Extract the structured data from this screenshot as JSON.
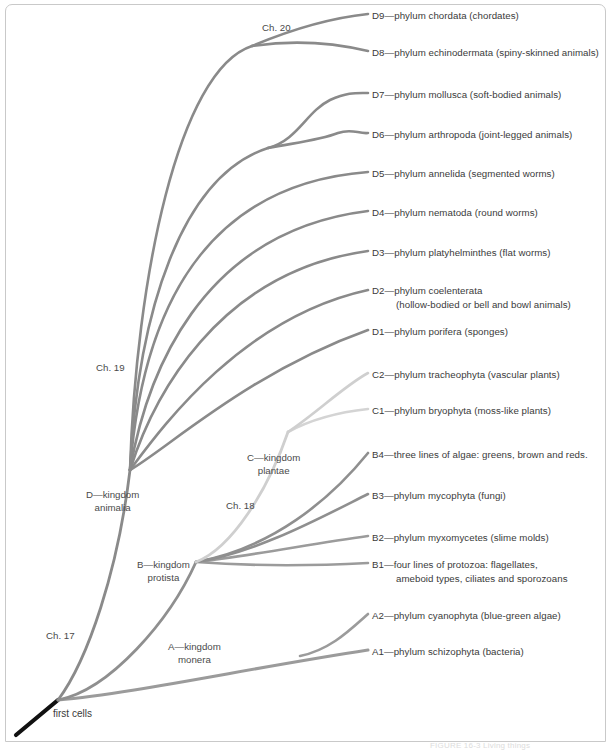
{
  "figure": {
    "caption": "FIGURE 16-3 Living things",
    "root_label": "first cells",
    "background_color": "#ffffff",
    "frame_color": "#c9c9c9"
  },
  "palette": {
    "animal_branch": "#8a8a8a",
    "protist_branch": "#9a9a9a",
    "plant_branch": "#cccccc",
    "monera_branch": "#999999",
    "root_stem": "#111111",
    "text": "#3a3a3a"
  },
  "chapters": [
    {
      "id": "ch17",
      "label": "Ch. 17",
      "x": 46,
      "y": 630
    },
    {
      "id": "ch18",
      "label": "Ch. 18",
      "x": 226,
      "y": 500
    },
    {
      "id": "ch19",
      "label": "Ch. 19",
      "x": 96,
      "y": 362
    },
    {
      "id": "ch20",
      "label": "Ch. 20",
      "x": 262,
      "y": 22
    }
  ],
  "kingdoms": [
    {
      "id": "monera",
      "line1": "A—kingdom",
      "line2": "monera",
      "x": 168,
      "y": 640
    },
    {
      "id": "protista",
      "line1": "B—kingdom",
      "line2": "protista",
      "x": 137,
      "y": 558
    },
    {
      "id": "plantae",
      "line1": "C—kingdom",
      "line2": "plantae",
      "x": 247,
      "y": 451
    },
    {
      "id": "animalia",
      "line1": "D—kingdom",
      "line2": "animalia",
      "x": 86,
      "y": 488
    }
  ],
  "leaves": [
    {
      "id": "D9",
      "line1": "D9—phylum chordata (chordates)",
      "line2": "",
      "x": 372,
      "y": 9
    },
    {
      "id": "D8",
      "line1": "D8—phylum echinodermata (spiny-skinned animals)",
      "line2": "",
      "x": 372,
      "y": 46
    },
    {
      "id": "D7",
      "line1": "D7—phylum mollusca (soft-bodied animals)",
      "line2": "",
      "x": 372,
      "y": 88
    },
    {
      "id": "D6",
      "line1": "D6—phylum arthropoda (joint-legged animals)",
      "line2": "",
      "x": 372,
      "y": 128
    },
    {
      "id": "D5",
      "line1": "D5—phylum annelida (segmented worms)",
      "line2": "",
      "x": 372,
      "y": 167
    },
    {
      "id": "D4",
      "line1": "D4—phylum nematoda (round worms)",
      "line2": "",
      "x": 372,
      "y": 206
    },
    {
      "id": "D3",
      "line1": "D3—phylum platyhelminthes (flat worms)",
      "line2": "",
      "x": 372,
      "y": 246
    },
    {
      "id": "D2",
      "line1": "D2—phylum coelenterata",
      "line2": "(hollow-bodied or bell and bowl animals)",
      "x": 372,
      "y": 284
    },
    {
      "id": "D1",
      "line1": "D1—phylum porifera (sponges)",
      "line2": "",
      "x": 372,
      "y": 325
    },
    {
      "id": "C2",
      "line1": "C2—phylum tracheophyta (vascular plants)",
      "line2": "",
      "x": 372,
      "y": 368
    },
    {
      "id": "C1",
      "line1": "C1—phylum bryophyta (moss-like plants)",
      "line2": "",
      "x": 372,
      "y": 404
    },
    {
      "id": "B4",
      "line1": "B4—three lines of algae: greens, brown and reds.",
      "line2": "",
      "x": 372,
      "y": 448
    },
    {
      "id": "B3",
      "line1": "B3—phylum mycophyta (fungi)",
      "line2": "",
      "x": 372,
      "y": 489
    },
    {
      "id": "B2",
      "line1": "B2—phylum myxomycetes (slime molds)",
      "line2": "",
      "x": 372,
      "y": 531
    },
    {
      "id": "B1",
      "line1": "B1—four lines of protozoa: flagellates,",
      "line2": "ameboid types, ciliates and sporozoans",
      "x": 372,
      "y": 558
    },
    {
      "id": "A2",
      "line1": "A2—phylum cyanophyta (blue-green algae)",
      "line2": "",
      "x": 372,
      "y": 609
    },
    {
      "id": "A1",
      "line1": "A1—phylum schizophyta (bacteria)",
      "line2": "",
      "x": 372,
      "y": 645
    }
  ],
  "branches": [
    {
      "id": "root-stem",
      "d": "M 16 735 L 58 700",
      "color": "#111111",
      "width": 4.2
    },
    {
      "id": "branch-monera",
      "d": "M 58 700 C 130 694 250 668 368 650",
      "color": "#9b9b9b",
      "width": 3.0
    },
    {
      "id": "branch-A2",
      "d": "M 300 656 C 330 650 350 630 368 614",
      "color": "#9b9b9b",
      "width": 2.6
    },
    {
      "id": "branch-protista",
      "d": "M 58 700 C 110 690 170 620 196 562",
      "color": "#8f8f8f",
      "width": 2.8
    },
    {
      "id": "branch-B1",
      "d": "M 196 562 C 250 566 310 566 368 563",
      "color": "#9b9b9b",
      "width": 2.6
    },
    {
      "id": "branch-B2",
      "d": "M 196 562 C 250 556 310 544 368 536",
      "color": "#9b9b9b",
      "width": 2.6
    },
    {
      "id": "branch-B3",
      "d": "M 196 562 C 258 552 320 518 368 494",
      "color": "#8f8f8f",
      "width": 2.6
    },
    {
      "id": "branch-B4",
      "d": "M 196 562 C 272 548 330 500 368 453",
      "color": "#8f8f8f",
      "width": 2.6
    },
    {
      "id": "branch-plantae",
      "d": "M 196 562 C 232 548 268 490 288 432",
      "color": "#cfcfcf",
      "width": 2.8
    },
    {
      "id": "branch-C1",
      "d": "M 288 432 C 310 420 340 412 368 409",
      "color": "#d4d4d4",
      "width": 2.6
    },
    {
      "id": "branch-C2",
      "d": "M 288 432 C 318 412 344 386 368 373",
      "color": "#cfcfcf",
      "width": 2.6
    },
    {
      "id": "branch-animalia",
      "d": "M 58 700 C 88 660 118 570 130 470",
      "color": "#8a8a8a",
      "width": 2.8
    },
    {
      "id": "branch-D1",
      "d": "M 130 470 C 168 448 250 372 368 330",
      "color": "#8a8a8a",
      "width": 2.6
    },
    {
      "id": "branch-D2",
      "d": "M 130 470 C 160 430 240 318 368 290",
      "color": "#8a8a8a",
      "width": 2.6
    },
    {
      "id": "branch-D3",
      "d": "M 130 470 C 152 400 216 272 368 251",
      "color": "#8a8a8a",
      "width": 2.6
    },
    {
      "id": "branch-D4",
      "d": "M 130 470 C 146 378 198 232 368 211",
      "color": "#8a8a8a",
      "width": 2.6
    },
    {
      "id": "branch-D5",
      "d": "M 130 470 C 140 340 186 186 368 172",
      "color": "#8a8a8a",
      "width": 2.6
    },
    {
      "id": "branch-D67",
      "d": "M 130 470 C 138 310 182 176 268 148",
      "color": "#8a8a8a",
      "width": 2.6
    },
    {
      "id": "branch-D6",
      "d": "M 268 148 C 300 142 320 140 338 133 C 352 128 358 134 368 133",
      "color": "#8a8a8a",
      "width": 2.6
    },
    {
      "id": "branch-D7",
      "d": "M 268 148 C 298 140 306 112 330 100 C 348 92 356 93 368 93",
      "color": "#8a8a8a",
      "width": 2.6
    },
    {
      "id": "branch-D89",
      "d": "M 130 470 C 136 280 178 70 252 46",
      "color": "#8a8a8a",
      "width": 2.6
    },
    {
      "id": "branch-D8",
      "d": "M 252 46 C 292 40 330 42 368 51",
      "color": "#8a8a8a",
      "width": 2.6
    },
    {
      "id": "branch-D9",
      "d": "M 252 46 C 290 30 330 18 368 14",
      "color": "#8a8a8a",
      "width": 2.6
    }
  ]
}
